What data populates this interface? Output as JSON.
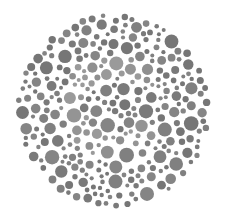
{
  "plate": {
    "type": "color-vision-test-plate",
    "center": [
      113,
      111
    ],
    "radius": 98,
    "background": "#ffffff",
    "dot_colors": {
      "base": [
        "#7a7a7a",
        "#808080",
        "#858585",
        "#767676"
      ],
      "figure": [
        "#949494",
        "#9a9a9a",
        "#8f8f8f"
      ]
    },
    "seed": 7
  }
}
